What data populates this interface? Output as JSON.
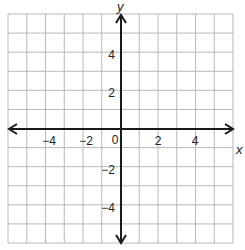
{
  "chart_data": {
    "type": "scatter",
    "title": "",
    "xlabel": "x",
    "ylabel": "y",
    "xlim": [
      -6,
      6
    ],
    "ylim": [
      -6,
      6
    ],
    "grid": true,
    "grid_step": 1,
    "x_ticks": [
      -4,
      -2,
      0,
      2,
      4
    ],
    "y_ticks": [
      -4,
      -2,
      2,
      4
    ],
    "x_tick_labels": [
      "−4",
      "−2",
      "0",
      "2",
      "4"
    ],
    "y_tick_labels": [
      "−4",
      "−2",
      "2",
      "4"
    ],
    "origin_label": "0",
    "series": [],
    "axis_arrows": true,
    "legend": null
  },
  "colors": {
    "grid": "#b8b8b8",
    "axis": "#1a1a1a",
    "background": "#ffffff",
    "text": "#222222"
  },
  "labels": {
    "x_axis": "x",
    "y_axis": "y",
    "origin": "0",
    "x_tick_neg4": "−4",
    "x_tick_neg2": "−2",
    "x_tick_2": "2",
    "x_tick_4": "4",
    "y_tick_4": "4",
    "y_tick_2": "2",
    "y_tick_neg2": "−2",
    "y_tick_neg4": "−4"
  }
}
